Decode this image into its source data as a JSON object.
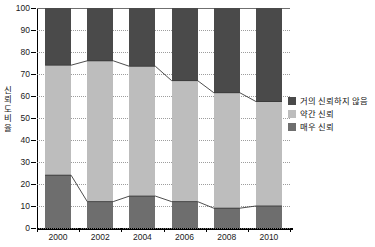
{
  "chart_data": {
    "type": "bar",
    "title": "",
    "subtitle": "",
    "xlabel": "",
    "ylabel": "신뢰도 비율",
    "categories": [
      "2000",
      "2002",
      "2004",
      "2006",
      "2008",
      "2010"
    ],
    "ylim": [
      0,
      100
    ],
    "y_ticks": [
      0,
      10,
      20,
      30,
      40,
      50,
      60,
      70,
      80,
      90,
      100
    ],
    "grid": true,
    "stacked": true,
    "legend_position": "right",
    "series": [
      {
        "name": "거의 신뢰하지 않음",
        "color": "#4a4a4a",
        "values": [
          26,
          24,
          26.5,
          33,
          38.5,
          42.5
        ]
      },
      {
        "name": "약간 신뢰",
        "color": "#bdbdbd",
        "values": [
          50,
          64,
          59,
          55,
          52.5,
          47.5
        ]
      },
      {
        "name": "매우 신뢰",
        "color": "#6e6e6e",
        "values": [
          24,
          12,
          14.5,
          12,
          9,
          10
        ]
      }
    ],
    "cumulative_top_of_light": [
      74,
      76,
      73.5,
      67,
      61.5,
      57.5
    ],
    "annotations": {
      "connector_lines": "two trend lines connect the top of the light-gray segment and the top of the bottom dark-gray segment across years"
    }
  },
  "legend": {
    "items": [
      {
        "label": "거의 신뢰하지 않음",
        "color": "#4a4a4a"
      },
      {
        "label": "약간 신뢰",
        "color": "#bdbdbd"
      },
      {
        "label": "매우 신뢰",
        "color": "#6e6e6e"
      }
    ]
  },
  "axis": {
    "y_title_chars": [
      "신",
      "뢰",
      "도",
      "비",
      "율"
    ],
    "y_tick_labels": [
      "100",
      "90",
      "80",
      "70",
      "60",
      "50",
      "40",
      "30",
      "20",
      "10",
      "0"
    ],
    "x_tick_labels": [
      "2000",
      "2002",
      "2004",
      "2006",
      "2008",
      "2010"
    ]
  }
}
